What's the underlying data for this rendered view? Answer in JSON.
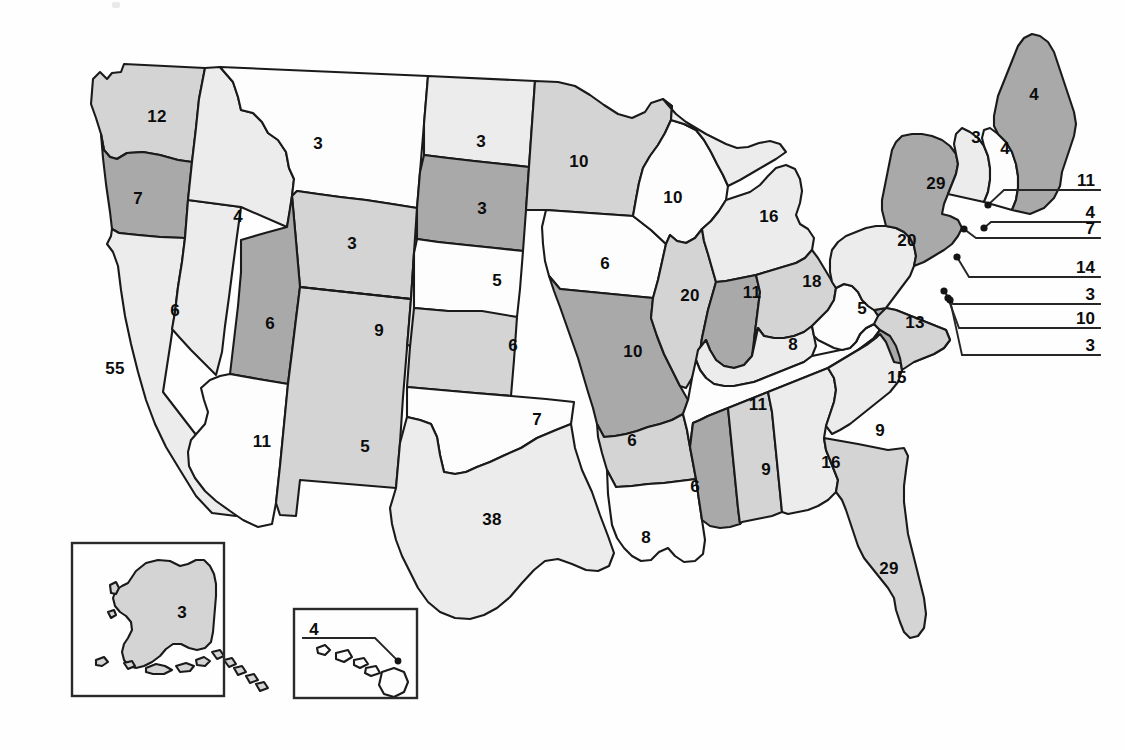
{
  "palette": {
    "background": "#ffffff",
    "outline": "#1a1a1a",
    "text": "#0c0c0c",
    "tier_white": "#fdfdfd",
    "tier_light": "#ececec",
    "tier_mid": "#d4d4d4",
    "tier_dark": "#a9a9a9"
  },
  "chart_data": {
    "type": "map",
    "value_label": "Electoral votes",
    "total_votes": 538,
    "shade_tiers": [
      "tier_white",
      "tier_light",
      "tier_mid",
      "tier_dark"
    ],
    "states": [
      {
        "code": "WA",
        "name": "Washington",
        "value": "12",
        "shade": "tier_mid",
        "lx": 157,
        "ly": 116
      },
      {
        "code": "OR",
        "name": "Oregon",
        "value": "7",
        "shade": "tier_dark",
        "lx": 138,
        "ly": 198
      },
      {
        "code": "CA",
        "name": "California",
        "value": "55",
        "shade": "tier_light",
        "lx": 115,
        "ly": 368
      },
      {
        "code": "NV",
        "name": "Nevada",
        "value": "6",
        "shade": "tier_light",
        "lx": 175,
        "ly": 310
      },
      {
        "code": "ID",
        "name": "Idaho",
        "value": "4",
        "shade": "tier_light",
        "lx": 238,
        "ly": 216
      },
      {
        "code": "MT",
        "name": "Montana",
        "value": "3",
        "shade": "tier_white",
        "lx": 318,
        "ly": 143
      },
      {
        "code": "WY",
        "name": "Wyoming",
        "value": "3",
        "shade": "tier_mid",
        "lx": 352,
        "ly": 243
      },
      {
        "code": "UT",
        "name": "Utah",
        "value": "6",
        "shade": "tier_dark",
        "lx": 270,
        "ly": 323
      },
      {
        "code": "AZ",
        "name": "Arizona",
        "value": "11",
        "shade": "tier_white",
        "lx": 262,
        "ly": 441
      },
      {
        "code": "NM",
        "name": "New Mexico",
        "value": "5",
        "shade": "tier_mid",
        "lx": 365,
        "ly": 446
      },
      {
        "code": "CO",
        "name": "Colorado",
        "value": "9",
        "shade": "tier_light",
        "lx": 379,
        "ly": 330
      },
      {
        "code": "ND",
        "name": "North Dakota",
        "value": "3",
        "shade": "tier_light",
        "lx": 481,
        "ly": 141
      },
      {
        "code": "SD",
        "name": "South Dakota",
        "value": "3",
        "shade": "tier_dark",
        "lx": 482,
        "ly": 208
      },
      {
        "code": "NE",
        "name": "Nebraska",
        "value": "5",
        "shade": "tier_white",
        "lx": 497,
        "ly": 280
      },
      {
        "code": "KS",
        "name": "Kansas",
        "value": "6",
        "shade": "tier_mid",
        "lx": 513,
        "ly": 345
      },
      {
        "code": "OK",
        "name": "Oklahoma",
        "value": "7",
        "shade": "tier_white",
        "lx": 537,
        "ly": 419
      },
      {
        "code": "TX",
        "name": "Texas",
        "value": "38",
        "shade": "tier_light",
        "lx": 492,
        "ly": 519
      },
      {
        "code": "MN",
        "name": "Minnesota",
        "value": "10",
        "shade": "tier_mid",
        "lx": 579,
        "ly": 161
      },
      {
        "code": "IA",
        "name": "Iowa",
        "value": "6",
        "shade": "tier_white",
        "lx": 605,
        "ly": 263
      },
      {
        "code": "MO",
        "name": "Missouri",
        "value": "10",
        "shade": "tier_dark",
        "lx": 633,
        "ly": 351
      },
      {
        "code": "AR",
        "name": "Arkansas",
        "value": "6",
        "shade": "tier_mid",
        "lx": 632,
        "ly": 440
      },
      {
        "code": "LA",
        "name": "Louisiana",
        "value": "8",
        "shade": "tier_white",
        "lx": 646,
        "ly": 537
      },
      {
        "code": "WI",
        "name": "Wisconsin",
        "value": "10",
        "shade": "tier_white",
        "lx": 673,
        "ly": 197
      },
      {
        "code": "IL",
        "name": "Illinois",
        "value": "20",
        "shade": "tier_mid",
        "lx": 690,
        "ly": 295
      },
      {
        "code": "MI",
        "name": "Michigan",
        "value": "16",
        "shade": "tier_light",
        "lx": 769,
        "ly": 216
      },
      {
        "code": "IN",
        "name": "Indiana",
        "value": "11",
        "shade": "tier_dark",
        "lx": 752,
        "ly": 292
      },
      {
        "code": "OH",
        "name": "Ohio",
        "value": "18",
        "shade": "tier_mid",
        "lx": 812,
        "ly": 281
      },
      {
        "code": "KY",
        "name": "Kentucky",
        "value": "8",
        "shade": "tier_light",
        "lx": 793,
        "ly": 344
      },
      {
        "code": "TN",
        "name": "Tennessee",
        "value": "11",
        "shade": "tier_white",
        "lx": 758,
        "ly": 404
      },
      {
        "code": "MS",
        "name": "Mississippi",
        "value": "6",
        "shade": "tier_dark",
        "lx": 695,
        "ly": 486
      },
      {
        "code": "AL",
        "name": "Alabama",
        "value": "9",
        "shade": "tier_mid",
        "lx": 766,
        "ly": 469
      },
      {
        "code": "GA",
        "name": "Georgia",
        "value": "16",
        "shade": "tier_light",
        "lx": 831,
        "ly": 462
      },
      {
        "code": "FL",
        "name": "Florida",
        "value": "29",
        "shade": "tier_mid",
        "lx": 889,
        "ly": 568
      },
      {
        "code": "SC",
        "name": "South Carolina",
        "value": "9",
        "shade": "tier_light",
        "lx": 880,
        "ly": 430
      },
      {
        "code": "NC",
        "name": "North Carolina",
        "value": "15",
        "shade": "tier_dark",
        "lx": 897,
        "ly": 377
      },
      {
        "code": "VA",
        "name": "Virginia",
        "value": "13",
        "shade": "tier_mid",
        "lx": 915,
        "ly": 322
      },
      {
        "code": "WV",
        "name": "West Virginia",
        "value": "5",
        "shade": "tier_white",
        "lx": 862,
        "ly": 308
      },
      {
        "code": "PA",
        "name": "Pennsylvania",
        "value": "20",
        "shade": "tier_light",
        "lx": 907,
        "ly": 240
      },
      {
        "code": "NY",
        "name": "New York",
        "value": "29",
        "shade": "tier_dark",
        "lx": 936,
        "ly": 183
      },
      {
        "code": "VT",
        "name": "Vermont",
        "value": "3",
        "shade": "tier_light",
        "lx": 976,
        "ly": 137
      },
      {
        "code": "NH",
        "name": "New Hampshire",
        "value": "4",
        "shade": "tier_white",
        "lx": 1005,
        "ly": 148
      },
      {
        "code": "ME",
        "name": "Maine",
        "value": "4",
        "shade": "tier_dark",
        "lx": 1034,
        "ly": 94
      },
      {
        "code": "AK",
        "name": "Alaska",
        "value": "3",
        "shade": "tier_mid",
        "lx": 182,
        "ly": 612
      },
      {
        "code": "HI",
        "name": "Hawaii",
        "value": "4",
        "shade": "tier_white",
        "lx": 314,
        "ly": 629
      }
    ],
    "callouts": [
      {
        "code": "MA",
        "name": "Massachusetts",
        "value": "11",
        "lx": 1095,
        "ly": 180,
        "elbow_x": 1004,
        "dot_x": 988,
        "dot_y": 205
      },
      {
        "code": "RI",
        "name": "Rhode Island",
        "value": "4",
        "lx": 1095,
        "ly": 212,
        "elbow_x": 991,
        "dot_x": 984,
        "dot_y": 228
      },
      {
        "code": "CT",
        "name": "Connecticut",
        "value": "7",
        "lx": 1095,
        "ly": 228,
        "elbow_x": 976,
        "dot_x": 964,
        "dot_y": 229
      },
      {
        "code": "NJ",
        "name": "New Jersey",
        "value": "14",
        "lx": 1095,
        "ly": 267,
        "elbow_x": 969,
        "dot_x": 957,
        "dot_y": 257
      },
      {
        "code": "DE",
        "name": "Delaware",
        "value": "3",
        "lx": 1095,
        "ly": 294,
        "elbow_x": 953,
        "dot_x": 944,
        "dot_y": 291
      },
      {
        "code": "MD",
        "name": "Maryland",
        "value": "10",
        "lx": 1095,
        "ly": 318,
        "elbow_x": 959,
        "dot_x": 948,
        "dot_y": 298
      },
      {
        "code": "DC",
        "name": "District of Columbia",
        "value": "3",
        "lx": 1095,
        "ly": 345,
        "elbow_x": 962,
        "dot_x": 950,
        "dot_y": 300
      }
    ],
    "insets": [
      {
        "name": "alaska-inset",
        "x": 72,
        "y": 543,
        "w": 152,
        "h": 153
      },
      {
        "name": "hawaii-inset",
        "x": 294,
        "y": 609,
        "w": 123,
        "h": 89
      }
    ]
  }
}
